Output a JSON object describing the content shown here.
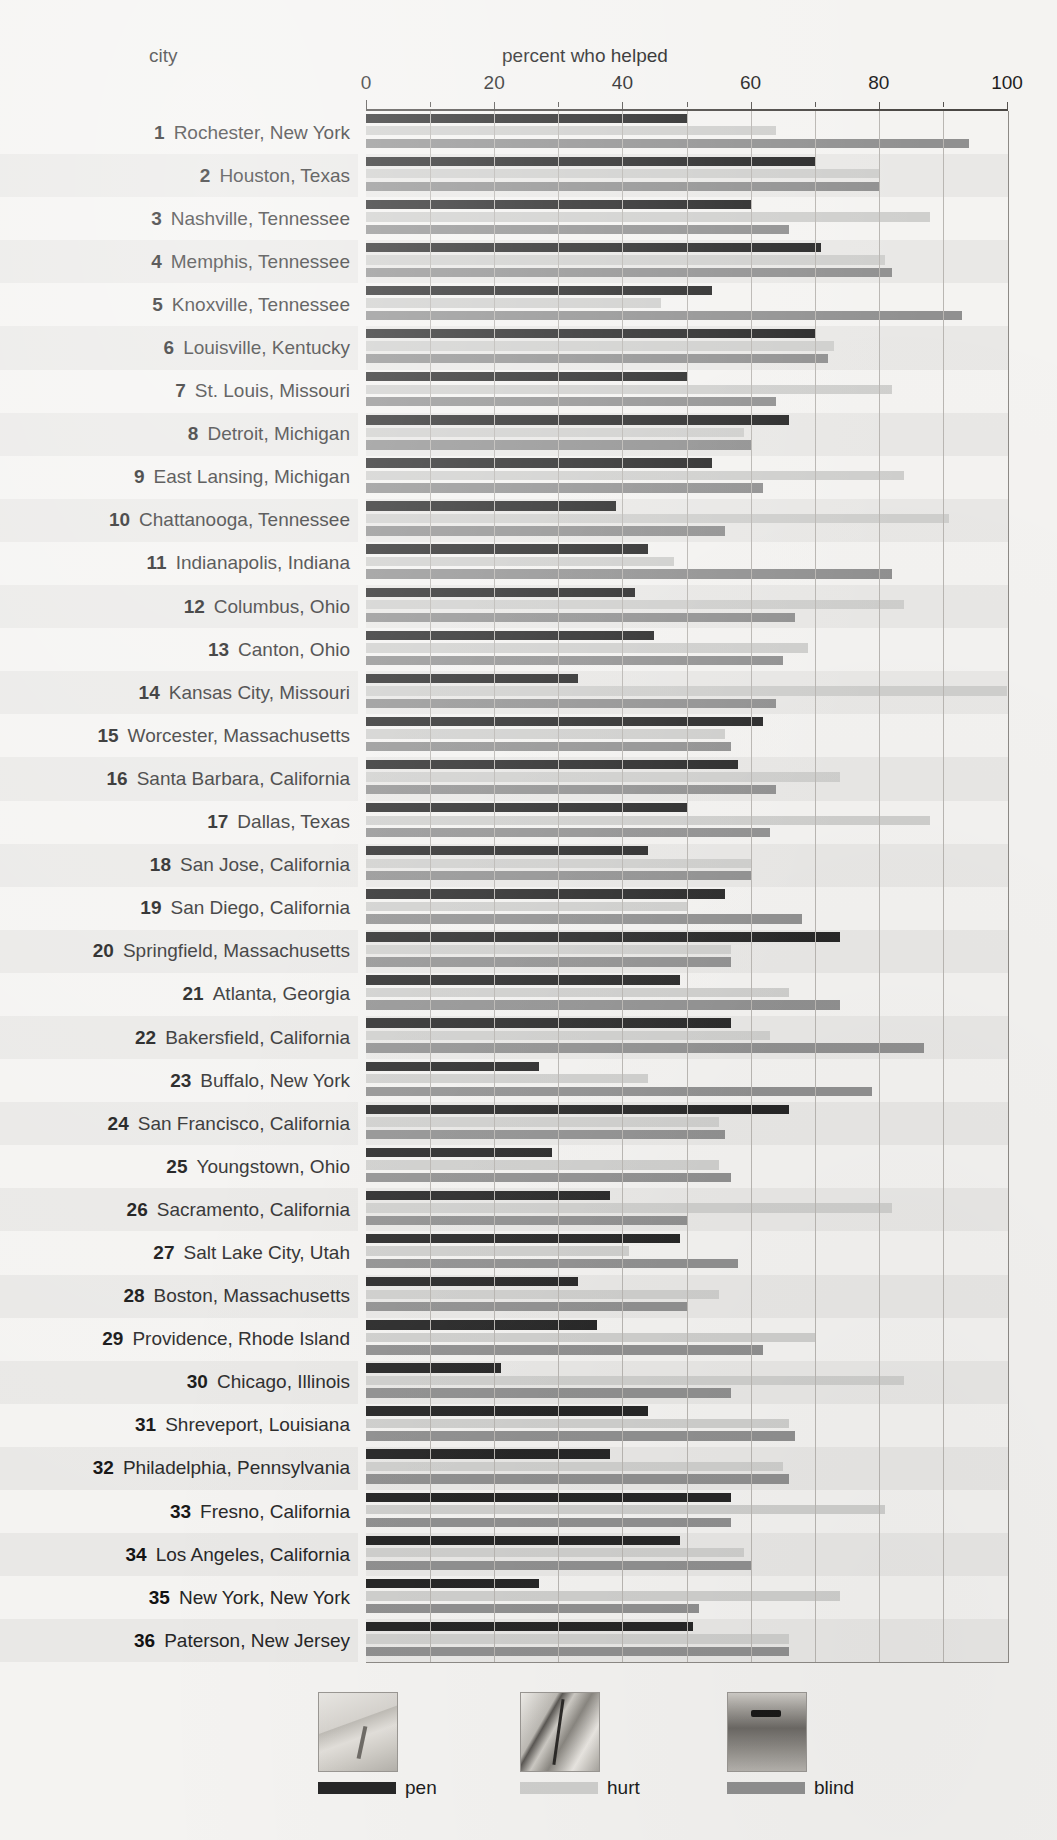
{
  "header": {
    "category_label": "city",
    "value_label": "percent who helped"
  },
  "axis": {
    "ticks": [
      0,
      20,
      40,
      60,
      80,
      100
    ],
    "minor_step": 10,
    "min": 0,
    "max": 100
  },
  "legend": [
    {
      "key": "pen",
      "label": "pen",
      "color": "#272727",
      "thumb": "dropped-pen-photo"
    },
    {
      "key": "hurt",
      "label": "hurt",
      "color": "#cfcfcd",
      "thumb": "hurt-leg-photo"
    },
    {
      "key": "blind",
      "label": "blind",
      "color": "#909090",
      "thumb": "blind-man-photo"
    }
  ],
  "chart_data": {
    "type": "bar",
    "orientation": "horizontal",
    "title": "percent who helped",
    "xlabel": "percent who helped",
    "ylabel": "city",
    "xlim": [
      0,
      100
    ],
    "grid": true,
    "legend_position": "bottom",
    "categories": [
      "Rochester, New York",
      "Houston, Texas",
      "Nashville, Tennessee",
      "Memphis, Tennessee",
      "Knoxville, Tennessee",
      "Louisville, Kentucky",
      "St. Louis, Missouri",
      "Detroit, Michigan",
      "East Lansing, Michigan",
      "Chattanooga, Tennessee",
      "Indianapolis, Indiana",
      "Columbus, Ohio",
      "Canton, Ohio",
      "Kansas City, Missouri",
      "Worcester, Massachusetts",
      "Santa Barbara, California",
      "Dallas, Texas",
      "San Jose, California",
      "San Diego, California",
      "Springfield, Massachusetts",
      "Atlanta, Georgia",
      "Bakersfield, California",
      "Buffalo, New York",
      "San Francisco, California",
      "Youngstown, Ohio",
      "Sacramento, California",
      "Salt Lake City, Utah",
      "Boston, Massachusetts",
      "Providence, Rhode Island",
      "Chicago, Illinois",
      "Shreveport, Louisiana",
      "Philadelphia, Pennsylvania",
      "Fresno, California",
      "Los Angeles, California",
      "New York, New York",
      "Paterson, New Jersey"
    ],
    "ranks": [
      1,
      2,
      3,
      4,
      5,
      6,
      7,
      8,
      9,
      10,
      11,
      12,
      13,
      14,
      15,
      16,
      17,
      18,
      19,
      20,
      21,
      22,
      23,
      24,
      25,
      26,
      27,
      28,
      29,
      30,
      31,
      32,
      33,
      34,
      35,
      36
    ],
    "series": [
      {
        "name": "pen",
        "color": "#272727",
        "values": [
          50,
          70,
          60,
          71,
          54,
          70,
          50,
          66,
          54,
          39,
          44,
          42,
          45,
          33,
          62,
          58,
          50,
          44,
          56,
          74,
          49,
          57,
          27,
          66,
          29,
          38,
          49,
          33,
          36,
          21,
          44,
          38,
          57,
          49,
          27,
          51
        ]
      },
      {
        "name": "hurt",
        "color": "#cfcfcd",
        "values": [
          64,
          80,
          88,
          81,
          46,
          73,
          82,
          59,
          84,
          91,
          48,
          84,
          69,
          100,
          56,
          74,
          88,
          60,
          50,
          57,
          66,
          63,
          44,
          55,
          55,
          82,
          41,
          55,
          70,
          84,
          66,
          65,
          81,
          59,
          74,
          66
        ]
      },
      {
        "name": "blind",
        "color": "#909090",
        "values": [
          94,
          80,
          66,
          82,
          93,
          72,
          64,
          60,
          62,
          56,
          82,
          67,
          65,
          64,
          57,
          64,
          63,
          60,
          68,
          57,
          74,
          87,
          79,
          56,
          57,
          50,
          58,
          50,
          62,
          57,
          67,
          66,
          57,
          60,
          52,
          66
        ]
      }
    ]
  }
}
